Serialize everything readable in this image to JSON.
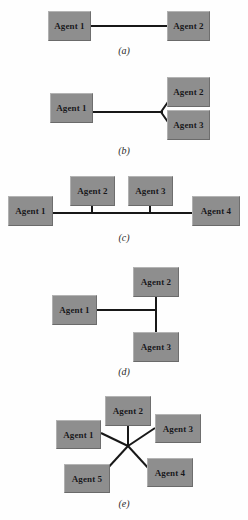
{
  "figure": {
    "background_color": "#fefefe",
    "node_fill": "#8e8e8e",
    "link_color": "#181818",
    "label_color": "#17171a"
  },
  "subfigures": [
    {
      "id": "a",
      "caption": "(a)",
      "topology": "point-to-point",
      "nodes": [
        {
          "label": "Agent 1",
          "x": 48,
          "y": 11,
          "w": 43,
          "h": 30
        },
        {
          "label": "Agent 2",
          "x": 167,
          "y": 11,
          "w": 43,
          "h": 30
        }
      ],
      "links": [
        {
          "from": "Agent 1",
          "to": "Agent 2",
          "kind": "straight"
        }
      ],
      "caption_x": 124,
      "caption_y": 45
    },
    {
      "id": "b",
      "caption": "(b)",
      "topology": "branching-bus",
      "nodes": [
        {
          "label": "Agent 1",
          "x": 50,
          "y": 93,
          "w": 43,
          "h": 30
        },
        {
          "label": "Agent 2",
          "x": 167,
          "y": 77,
          "w": 43,
          "h": 30
        },
        {
          "label": "Agent 3",
          "x": 167,
          "y": 110,
          "w": 43,
          "h": 30
        }
      ],
      "links": [
        {
          "from": "Agent 1",
          "to": "branch-vertex",
          "kind": "straight"
        },
        {
          "from": "branch-vertex",
          "to": "Agent 2",
          "kind": "diagonal"
        },
        {
          "from": "branch-vertex",
          "to": "Agent 3",
          "kind": "diagonal"
        }
      ],
      "caption_x": 124,
      "caption_y": 145
    },
    {
      "id": "c",
      "caption": "(c)",
      "topology": "bus",
      "nodes": [
        {
          "label": "Agent 1",
          "x": 8,
          "y": 196,
          "w": 45,
          "h": 30
        },
        {
          "label": "Agent 2",
          "x": 70,
          "y": 176,
          "w": 45,
          "h": 30
        },
        {
          "label": "Agent 3",
          "x": 128,
          "y": 176,
          "w": 45,
          "h": 30
        },
        {
          "label": "Agent 4",
          "x": 192,
          "y": 196,
          "w": 48,
          "h": 30
        }
      ],
      "links": [
        {
          "from": "Agent 1",
          "to": "Agent 4",
          "kind": "bus-trunk"
        },
        {
          "from": "Agent 2",
          "to": "bus",
          "kind": "stub"
        },
        {
          "from": "Agent 3",
          "to": "bus",
          "kind": "stub"
        }
      ],
      "caption_x": 124,
      "caption_y": 232
    },
    {
      "id": "d",
      "caption": "(d)",
      "topology": "tee-bus",
      "nodes": [
        {
          "label": "Agent 2",
          "x": 133,
          "y": 267,
          "w": 46,
          "h": 30
        },
        {
          "label": "Agent 1",
          "x": 52,
          "y": 295,
          "w": 45,
          "h": 30
        },
        {
          "label": "Agent 3",
          "x": 133,
          "y": 332,
          "w": 46,
          "h": 30
        }
      ],
      "links": [
        {
          "from": "Agent 1",
          "to": "tee",
          "kind": "straight"
        },
        {
          "from": "Agent 2",
          "to": "Agent 3",
          "kind": "vertical-trunk"
        }
      ],
      "caption_x": 124,
      "caption_y": 366
    },
    {
      "id": "e",
      "caption": "(e)",
      "topology": "star",
      "nodes": [
        {
          "label": "Agent 2",
          "x": 105,
          "y": 396,
          "w": 46,
          "h": 30
        },
        {
          "label": "Agent 1",
          "x": 56,
          "y": 420,
          "w": 45,
          "h": 29
        },
        {
          "label": "Agent 3",
          "x": 155,
          "y": 414,
          "w": 46,
          "h": 29
        },
        {
          "label": "Agent 4",
          "x": 147,
          "y": 458,
          "w": 46,
          "h": 29
        },
        {
          "label": "Agent 5",
          "x": 64,
          "y": 464,
          "w": 46,
          "h": 29
        }
      ],
      "hub": {
        "x": 128,
        "y": 446
      },
      "links": [
        {
          "from": "Agent 1",
          "to": "hub",
          "kind": "spoke"
        },
        {
          "from": "Agent 2",
          "to": "hub",
          "kind": "spoke"
        },
        {
          "from": "Agent 3",
          "to": "hub",
          "kind": "spoke"
        },
        {
          "from": "Agent 4",
          "to": "hub",
          "kind": "spoke"
        },
        {
          "from": "Agent 5",
          "to": "hub",
          "kind": "spoke"
        }
      ],
      "caption_x": 124,
      "caption_y": 498
    }
  ]
}
